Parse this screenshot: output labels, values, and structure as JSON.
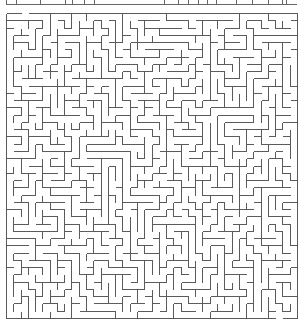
{
  "page": {
    "width": 305,
    "height": 321,
    "background": "#ffffff"
  },
  "previous_maze_fragment": {
    "line_y": 4,
    "x_start": 6,
    "x_end": 297,
    "tick_xs": [
      6,
      16,
      40,
      65,
      72,
      84,
      94,
      164,
      178,
      188,
      198,
      207,
      216,
      236,
      252,
      268,
      282,
      286
    ],
    "stroke": "#666666"
  },
  "maze": {
    "x": 6,
    "y": 13,
    "width": 291,
    "height": 305,
    "cols": 40,
    "rows": 42,
    "wall_color": "#5a5a5a",
    "wall_width": 1,
    "seed": 20240611,
    "entrance": {
      "side": "top",
      "col": 2
    },
    "exit": {
      "side": "bottom",
      "col": 37
    }
  }
}
